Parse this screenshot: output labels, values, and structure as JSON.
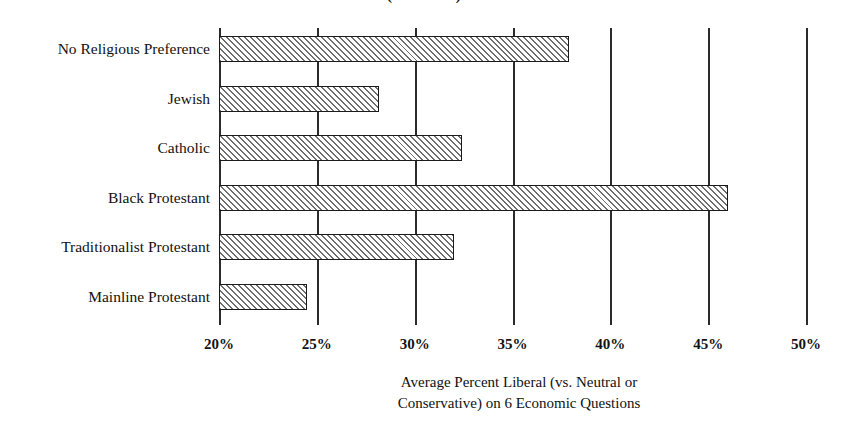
{
  "chart_data": {
    "type": "bar",
    "orientation": "horizontal",
    "title": "(GSS Data)",
    "xlabel_line1": "Average Percent Liberal (vs. Neutral or",
    "xlabel_line2": "Conservative) on 6 Economic Questions",
    "ylabel": "",
    "categories": [
      "No Religious Preference",
      "Jewish",
      "Catholic",
      "Black Protestant",
      "Traditionalist Protestant",
      "Mainline Protestant"
    ],
    "values": [
      37.9,
      28.2,
      32.4,
      46.0,
      32.0,
      24.5
    ],
    "xlim": [
      20,
      50
    ],
    "tick_values": [
      20,
      25,
      30,
      35,
      40,
      45,
      50
    ],
    "tick_labels": [
      "20%",
      "25%",
      "30%",
      "35%",
      "40%",
      "45%",
      "50%"
    ],
    "grid": true,
    "grid_axis": "x",
    "legend": false,
    "bar_fill": "diagonal-hatch",
    "bar_edge_color": "#1b1b1b",
    "bar_hatch_color": "#6f6f6f",
    "axis_color": "#1b1b1b"
  }
}
